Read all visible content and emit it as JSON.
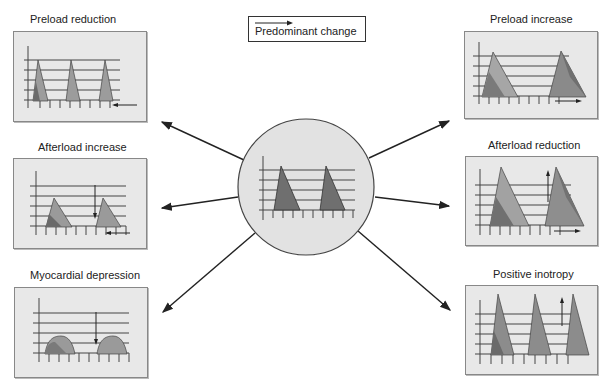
{
  "legend": {
    "label": "Predominant change"
  },
  "center": {
    "label": "Baseline pressure-volume loops"
  },
  "panels": [
    {
      "id": "preload-reduction",
      "title": "Preload reduction"
    },
    {
      "id": "afterload-increase",
      "title": "Afterload increase"
    },
    {
      "id": "myocardial-depression",
      "title": "Myocardial depression"
    },
    {
      "id": "preload-increase",
      "title": "Preload increase"
    },
    {
      "id": "afterload-reduction",
      "title": "Afterload reduction"
    },
    {
      "id": "positive-inotropy",
      "title": "Positive inotropy"
    }
  ],
  "colors": {
    "panel_bg": "#e8e8e8",
    "circle_bg": "#e2e2e2",
    "dark_fill": "#6a6a6a",
    "mid_fill": "#8c8c8c",
    "light_fill": "#b0b0b0",
    "line": "#333333"
  }
}
